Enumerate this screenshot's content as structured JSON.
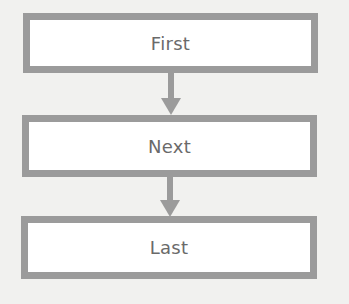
{
  "diagram": {
    "type": "flowchart",
    "direction": "top-to-bottom",
    "nodes": [
      {
        "id": "n1",
        "label": "First"
      },
      {
        "id": "n2",
        "label": "Next"
      },
      {
        "id": "n3",
        "label": "Last"
      }
    ],
    "edges": [
      {
        "from": "n1",
        "to": "n2"
      },
      {
        "from": "n2",
        "to": "n3"
      }
    ],
    "colors": {
      "border": "#9b9b9b",
      "arrow": "#9b9b9b",
      "text": "#6a6a6a",
      "box_fill": "#ffffff",
      "background": "#f1f1ef"
    }
  }
}
